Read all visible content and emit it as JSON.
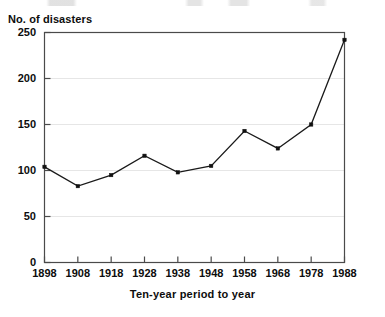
{
  "chart_data": {
    "type": "line",
    "title": "",
    "ylabel": "No. of disasters",
    "xlabel": "Ten-year period to year",
    "categories": [
      "1898",
      "1908",
      "1918",
      "1928",
      "1938",
      "1948",
      "1958",
      "1968",
      "1978",
      "1988"
    ],
    "x": [
      1898,
      1908,
      1918,
      1928,
      1938,
      1948,
      1958,
      1968,
      1978,
      1988
    ],
    "values": [
      104,
      83,
      95,
      116,
      98,
      105,
      143,
      124,
      150,
      242
    ],
    "series": [
      {
        "name": "No. of disasters",
        "values": [
          104,
          83,
          95,
          116,
          98,
          105,
          143,
          124,
          150,
          242
        ]
      }
    ],
    "ylim": [
      0,
      250
    ],
    "yticks": [
      0,
      50,
      100,
      150,
      200,
      250
    ],
    "ytick_labels": [
      "0",
      "50",
      "100",
      "150",
      "200",
      "250"
    ],
    "xlim": [
      1898,
      1988
    ],
    "xticks": [
      1898,
      1908,
      1918,
      1928,
      1938,
      1948,
      1958,
      1968,
      1978,
      1988
    ],
    "grid": "faint-horizontal",
    "legend": "none",
    "marker": "square",
    "line_color": "#1a1a1a",
    "marker_color": "#111111",
    "axis_color": "#4a4a4a",
    "grid_color": "#e6e6e6",
    "background": "#ffffff"
  },
  "figure": {
    "y_axis_title": "No. of disasters",
    "x_axis_title": "Ten-year period to year"
  }
}
